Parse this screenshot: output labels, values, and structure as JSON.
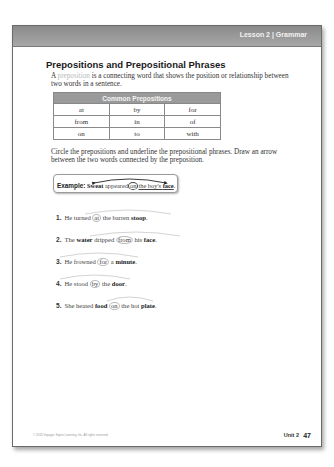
{
  "header": {
    "label": "Lesson 2 | Grammar"
  },
  "title": "Prepositions and Prepositional Phrases",
  "intro": {
    "prefix": "A ",
    "term": "preposition",
    "rest": " is a connecting word that shows the position or relationship between two words in a sentence."
  },
  "table": {
    "header": "Common Prepositions",
    "rows": [
      [
        "at",
        "by",
        "for"
      ],
      [
        "from",
        "in",
        "of"
      ],
      [
        "on",
        "to",
        "with"
      ]
    ]
  },
  "instructions": "Circle the prepositions and underline the prepositional phrases. Draw an arrow between the two words connected by the preposition.",
  "example": {
    "label": "Example:",
    "word1": "Sweat",
    "verb": " appeared",
    "prep": "on",
    "phrase_pre": "the boy's ",
    "word2": "face",
    "end": "."
  },
  "items": [
    {
      "num": "1.",
      "pre": "He turned ",
      "prep": "at",
      "mid": " the barren ",
      "obj": "stoop",
      "end": "."
    },
    {
      "num": "2.",
      "pre_plain": "The ",
      "subj": "water",
      "pre": " dripped ",
      "prep": "from",
      "mid": " his ",
      "obj": "face",
      "end": "."
    },
    {
      "num": "3.",
      "pre": "He frowned ",
      "prep": "for",
      "mid": " a ",
      "obj": "minute",
      "end": "."
    },
    {
      "num": "4.",
      "pre": "He stood ",
      "prep": "by",
      "mid": " the ",
      "obj": "door",
      "end": "."
    },
    {
      "num": "5.",
      "pre_plain": "She heated ",
      "subj": "food",
      "pre": " ",
      "prep": "on",
      "mid": " the hot ",
      "obj": "plate",
      "end": "."
    }
  ],
  "footer": {
    "copyright": "© 2015 Voyager Sopris Learning, Inc. All rights reserved.",
    "unit": "Unit 2",
    "page": "47"
  }
}
